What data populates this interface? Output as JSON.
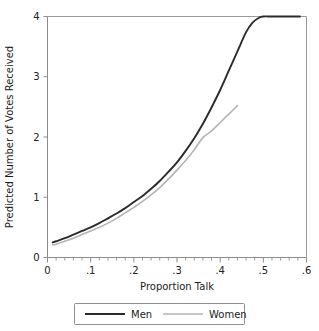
{
  "chart_data": {
    "type": "line",
    "title": "",
    "xlabel": "Proportion Talk",
    "ylabel": "Predicted Number of Votes Received",
    "xlim": [
      0,
      0.6
    ],
    "ylim": [
      0,
      4
    ],
    "grid": false,
    "legend_position": "bottom",
    "x_ticks": [
      "0",
      ".1",
      ".2",
      ".3",
      ".4",
      ".5",
      ".6"
    ],
    "x_tick_values": [
      0,
      0.1,
      0.2,
      0.3,
      0.4,
      0.5,
      0.6
    ],
    "x_minor_step": 0.02,
    "y_ticks": [
      "0",
      "1",
      "2",
      "3",
      "4"
    ],
    "y_tick_values": [
      0,
      1,
      2,
      3,
      4
    ],
    "series": [
      {
        "name": "Men",
        "color": "#2b2b2b",
        "x": [
          0.012,
          0.02,
          0.04,
          0.06,
          0.08,
          0.1,
          0.12,
          0.14,
          0.16,
          0.18,
          0.2,
          0.22,
          0.24,
          0.26,
          0.28,
          0.3,
          0.32,
          0.34,
          0.36,
          0.38,
          0.4,
          0.42,
          0.44,
          0.46,
          0.475,
          0.49,
          0.5,
          0.52,
          0.55,
          0.585
        ],
        "values": [
          0.25,
          0.27,
          0.32,
          0.38,
          0.44,
          0.5,
          0.57,
          0.65,
          0.73,
          0.82,
          0.92,
          1.02,
          1.14,
          1.27,
          1.42,
          1.58,
          1.77,
          1.98,
          2.22,
          2.49,
          2.78,
          3.1,
          3.42,
          3.74,
          3.9,
          3.98,
          4.0,
          4.0,
          4.0,
          4.0
        ]
      },
      {
        "name": "Women",
        "color": "#b4b4b4",
        "x": [
          0.012,
          0.02,
          0.04,
          0.06,
          0.08,
          0.1,
          0.12,
          0.14,
          0.16,
          0.18,
          0.2,
          0.22,
          0.24,
          0.26,
          0.28,
          0.3,
          0.32,
          0.34,
          0.36,
          0.38,
          0.4,
          0.42,
          0.44
        ],
        "values": [
          0.21,
          0.22,
          0.27,
          0.32,
          0.38,
          0.44,
          0.5,
          0.57,
          0.65,
          0.74,
          0.83,
          0.93,
          1.04,
          1.16,
          1.3,
          1.45,
          1.61,
          1.79,
          1.99,
          2.1,
          2.24,
          2.38,
          2.52
        ]
      }
    ]
  },
  "legend": {
    "items": [
      {
        "label": "Men",
        "color": "#2b2b2b"
      },
      {
        "label": "Women",
        "color": "#b4b4b4"
      }
    ]
  }
}
